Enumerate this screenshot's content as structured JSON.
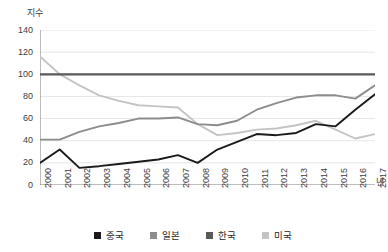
{
  "axes": {
    "y_unit_label": "지수",
    "x_unit_label": "년",
    "y_ticks": [
      "0",
      "20",
      "40",
      "60",
      "80",
      "100",
      "120",
      "140"
    ],
    "x_ticks": [
      "2000",
      "2001",
      "2002",
      "2003",
      "2004",
      "2005",
      "2006",
      "2007",
      "2008",
      "2009",
      "2010",
      "2011",
      "2012",
      "2013",
      "2014",
      "2015",
      "2016",
      "2017"
    ]
  },
  "legend": {
    "items": [
      {
        "label": "중국",
        "color": "#1a1a1a"
      },
      {
        "label": "일본",
        "color": "#8c8c8c"
      },
      {
        "label": "한국",
        "color": "#595959"
      },
      {
        "label": "미국",
        "color": "#c4c4c4"
      }
    ]
  },
  "chart_data": {
    "type": "line",
    "title": "",
    "xlabel": "년",
    "ylabel": "지수",
    "ylim": [
      0,
      140
    ],
    "grid": true,
    "legend_position": "bottom",
    "categories": [
      "2000",
      "2001",
      "2002",
      "2003",
      "2004",
      "2005",
      "2006",
      "2007",
      "2008",
      "2009",
      "2010",
      "2011",
      "2012",
      "2013",
      "2014",
      "2015",
      "2016",
      "2017"
    ],
    "series": [
      {
        "name": "중국",
        "color": "#1a1a1a",
        "values": [
          20,
          32,
          15.5,
          17,
          19,
          21,
          23,
          27,
          20,
          32,
          39,
          46,
          45,
          47,
          55,
          53,
          68,
          82
        ]
      },
      {
        "name": "일본",
        "color": "#8c8c8c",
        "values": [
          41,
          41,
          48,
          53,
          56,
          60,
          60,
          61,
          55,
          54,
          58,
          68,
          74,
          79,
          81,
          81,
          78,
          90
        ]
      },
      {
        "name": "한국",
        "color": "#595959",
        "values": [
          100,
          100,
          100,
          100,
          100,
          100,
          100,
          100,
          100,
          100,
          100,
          100,
          100,
          100,
          100,
          100,
          100,
          100
        ]
      },
      {
        "name": "미국",
        "color": "#c4c4c4",
        "values": [
          116,
          100,
          90,
          81,
          76,
          72,
          71,
          70,
          55,
          45,
          47,
          50,
          51,
          54,
          58,
          50,
          42,
          46
        ]
      }
    ]
  }
}
